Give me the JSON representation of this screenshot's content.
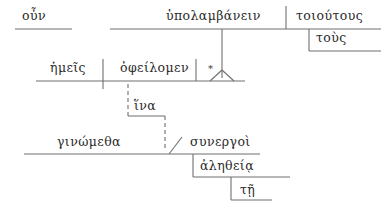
{
  "diagram": {
    "type": "reed-kellogg-sentence-diagram",
    "language": "Ancient Greek",
    "line_color": "#6f6f6f",
    "text_color": "#2b2b2b",
    "background": "#ffffff",
    "clauses": [
      {
        "id": "main-clause",
        "words": [
          {
            "id": "oun",
            "text": "οὖν",
            "role": "conjunction",
            "x": 22,
            "y": 10
          },
          {
            "id": "hupolambanein",
            "text": "ὑπολαμβάνειν",
            "role": "infinitive-predicate",
            "x": 166,
            "y": 10
          },
          {
            "id": "toioutous",
            "text": "τοιούτους",
            "role": "object",
            "x": 296,
            "y": 10
          },
          {
            "id": "tous",
            "text": "τοὺς",
            "role": "article-modifier",
            "x": 316,
            "y": 32
          }
        ]
      },
      {
        "id": "subject-clause",
        "words": [
          {
            "id": "hemeis",
            "text": "ἡμεῖς",
            "role": "subject",
            "x": 50,
            "y": 62
          },
          {
            "id": "opheilomen",
            "text": "ὀφείλομεν",
            "role": "verb",
            "x": 120,
            "y": 62
          },
          {
            "id": "asterisk",
            "text": "*",
            "role": "placeholder-object",
            "x": 208,
            "y": 64
          }
        ]
      },
      {
        "id": "purpose-clause-connector",
        "words": [
          {
            "id": "hina",
            "text": "ἵνα",
            "role": "subordinating-conjunction",
            "x": 134,
            "y": 100
          }
        ]
      },
      {
        "id": "purpose-clause",
        "words": [
          {
            "id": "ginometha",
            "text": "γινώμεθα",
            "role": "verb",
            "x": 57,
            "y": 136
          },
          {
            "id": "sunergoi",
            "text": "συνεργοὶ",
            "role": "predicate-nominative",
            "x": 190,
            "y": 136
          },
          {
            "id": "aletheia",
            "text": "ἀληθείᾳ",
            "role": "dative-modifier",
            "x": 200,
            "y": 160
          },
          {
            "id": "te",
            "text": "τῇ",
            "role": "article-modifier",
            "x": 240,
            "y": 184
          }
        ]
      }
    ],
    "baselines": [
      {
        "id": "oun-baseline",
        "x1": 15,
        "y1": 29,
        "x2": 72,
        "y2": 29,
        "style": "solid"
      },
      {
        "id": "main-predicate-baseline",
        "x1": 110,
        "y1": 29,
        "x2": 381,
        "y2": 29,
        "style": "solid"
      },
      {
        "id": "tous-baseline",
        "x1": 309,
        "y1": 51,
        "x2": 381,
        "y2": 51,
        "style": "solid"
      },
      {
        "id": "subject-verb-baseline",
        "x1": 36,
        "y1": 81,
        "x2": 245,
        "y2": 81,
        "style": "solid"
      },
      {
        "id": "hina-baseline",
        "x1": 128,
        "y1": 116,
        "x2": 165,
        "y2": 116,
        "style": "solid"
      },
      {
        "id": "lower-clause-baseline",
        "x1": 24,
        "y1": 154,
        "x2": 260,
        "y2": 154,
        "style": "solid"
      },
      {
        "id": "aletheia-baseline",
        "x1": 193,
        "y1": 177,
        "x2": 290,
        "y2": 177,
        "style": "solid"
      },
      {
        "id": "te-baseline",
        "x1": 231,
        "y1": 200,
        "x2": 272,
        "y2": 200,
        "style": "solid"
      }
    ],
    "dividers": [
      {
        "id": "object-divider-top",
        "x1": 286,
        "y1": 6,
        "x2": 286,
        "y2": 29,
        "style": "solid"
      },
      {
        "id": "subject-verb-divider",
        "x1": 103,
        "y1": 59,
        "x2": 103,
        "y2": 89,
        "style": "solid"
      },
      {
        "id": "verb-object-divider",
        "x1": 196,
        "y1": 59,
        "x2": 196,
        "y2": 81,
        "style": "solid"
      },
      {
        "id": "tous-riser",
        "x1": 309,
        "y1": 29,
        "x2": 309,
        "y2": 51,
        "style": "solid"
      },
      {
        "id": "aletheia-riser",
        "x1": 193,
        "y1": 154,
        "x2": 193,
        "y2": 177,
        "style": "solid"
      },
      {
        "id": "te-riser",
        "x1": 231,
        "y1": 177,
        "x2": 231,
        "y2": 200,
        "style": "solid"
      },
      {
        "id": "hina-left-riser",
        "x1": 128,
        "y1": 84,
        "x2": 128,
        "y2": 116,
        "style": "dashed"
      },
      {
        "id": "hina-right-riser",
        "x1": 165,
        "y1": 116,
        "x2": 165,
        "y2": 151,
        "style": "dashed"
      },
      {
        "id": "infinitive-stem",
        "x1": 222,
        "y1": 29,
        "x2": 222,
        "y2": 78,
        "style": "solid"
      }
    ],
    "slants": [
      {
        "id": "predicate-nominative-slant",
        "x1": 169,
        "y1": 154,
        "x2": 182,
        "y2": 137
      }
    ],
    "tripod": {
      "id": "infinitive-tripod",
      "apex_x": 222,
      "apex_y": 70,
      "left_x": 210,
      "left_y": 81,
      "right_x": 234,
      "right_y": 81
    }
  }
}
